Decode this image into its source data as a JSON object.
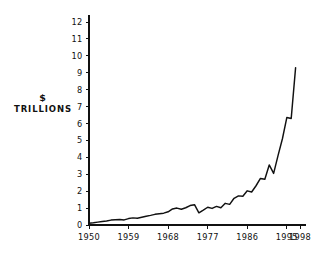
{
  "chart_data": {
    "type": "line",
    "title": "",
    "subtitle": "",
    "xlabel": "",
    "ylabel": "$ TRILLIONS",
    "ylabel_lines": [
      "$",
      "TRILLIONS"
    ],
    "xlim": [
      1950,
      1998
    ],
    "ylim": [
      0,
      12
    ],
    "grid": false,
    "legend": null,
    "y_ticks": [
      0,
      1,
      2,
      3,
      4,
      5,
      6,
      7,
      8,
      9,
      10,
      11,
      12
    ],
    "y_tick_labels": [
      "0",
      "1",
      "2",
      "3",
      "4",
      "5",
      "6",
      "7",
      "8",
      "9",
      "10",
      "11",
      "12"
    ],
    "x_ticks": [
      1950,
      1959,
      1968,
      1977,
      1986,
      1995,
      1998
    ],
    "x_tick_labels": [
      "1950",
      "1959",
      "1968",
      "1977",
      "1986",
      "1995",
      "1998"
    ],
    "series": [
      {
        "name": "$ Trillions",
        "color": "#111111",
        "x": [
          1950,
          1951,
          1952,
          1953,
          1954,
          1955,
          1956,
          1957,
          1958,
          1959,
          1960,
          1961,
          1962,
          1963,
          1964,
          1965,
          1966,
          1967,
          1968,
          1969,
          1970,
          1971,
          1972,
          1973,
          1974,
          1975,
          1976,
          1977,
          1978,
          1979,
          1980,
          1981,
          1982,
          1983,
          1984,
          1985,
          1986,
          1987,
          1988,
          1989,
          1990,
          1991,
          1992,
          1993,
          1994,
          1995,
          1996,
          1997
        ],
        "values": [
          0.1,
          0.13,
          0.17,
          0.21,
          0.24,
          0.29,
          0.31,
          0.33,
          0.3,
          0.38,
          0.42,
          0.4,
          0.46,
          0.52,
          0.57,
          0.63,
          0.67,
          0.7,
          0.78,
          0.95,
          1.0,
          0.93,
          1.02,
          1.15,
          1.2,
          0.72,
          0.88,
          1.05,
          0.98,
          1.1,
          1.02,
          1.28,
          1.22,
          1.58,
          1.72,
          1.7,
          2.02,
          1.95,
          2.32,
          2.75,
          2.7,
          3.55,
          3.05,
          4.1,
          5.1,
          6.35,
          6.3,
          9.3
        ]
      }
    ],
    "annotations": []
  },
  "colors": {
    "background": "#ffffff",
    "axis": "#111111",
    "series": "#111111",
    "text": "#111111"
  }
}
